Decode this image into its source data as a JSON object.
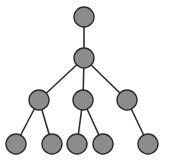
{
  "diagram": {
    "type": "tree",
    "style": {
      "node_fill": "#8c8c8c",
      "node_stroke": "#2b2b2b",
      "edge_color": "#2e2e2e",
      "node_radius": 10
    },
    "nodes": [
      {
        "id": "n0",
        "x": 84,
        "y": 17
      },
      {
        "id": "n1",
        "x": 84,
        "y": 58
      },
      {
        "id": "n2",
        "x": 39,
        "y": 100
      },
      {
        "id": "n3",
        "x": 83,
        "y": 100
      },
      {
        "id": "n4",
        "x": 127,
        "y": 100
      },
      {
        "id": "n5",
        "x": 16,
        "y": 144
      },
      {
        "id": "n6",
        "x": 52,
        "y": 144
      },
      {
        "id": "n7",
        "x": 77,
        "y": 144
      },
      {
        "id": "n8",
        "x": 103,
        "y": 144
      },
      {
        "id": "n9",
        "x": 148,
        "y": 144
      }
    ],
    "edges": [
      {
        "from": "n0",
        "to": "n1"
      },
      {
        "from": "n1",
        "to": "n2"
      },
      {
        "from": "n1",
        "to": "n3"
      },
      {
        "from": "n1",
        "to": "n4"
      },
      {
        "from": "n2",
        "to": "n5"
      },
      {
        "from": "n2",
        "to": "n6"
      },
      {
        "from": "n3",
        "to": "n7"
      },
      {
        "from": "n3",
        "to": "n8"
      },
      {
        "from": "n4",
        "to": "n9"
      }
    ]
  }
}
